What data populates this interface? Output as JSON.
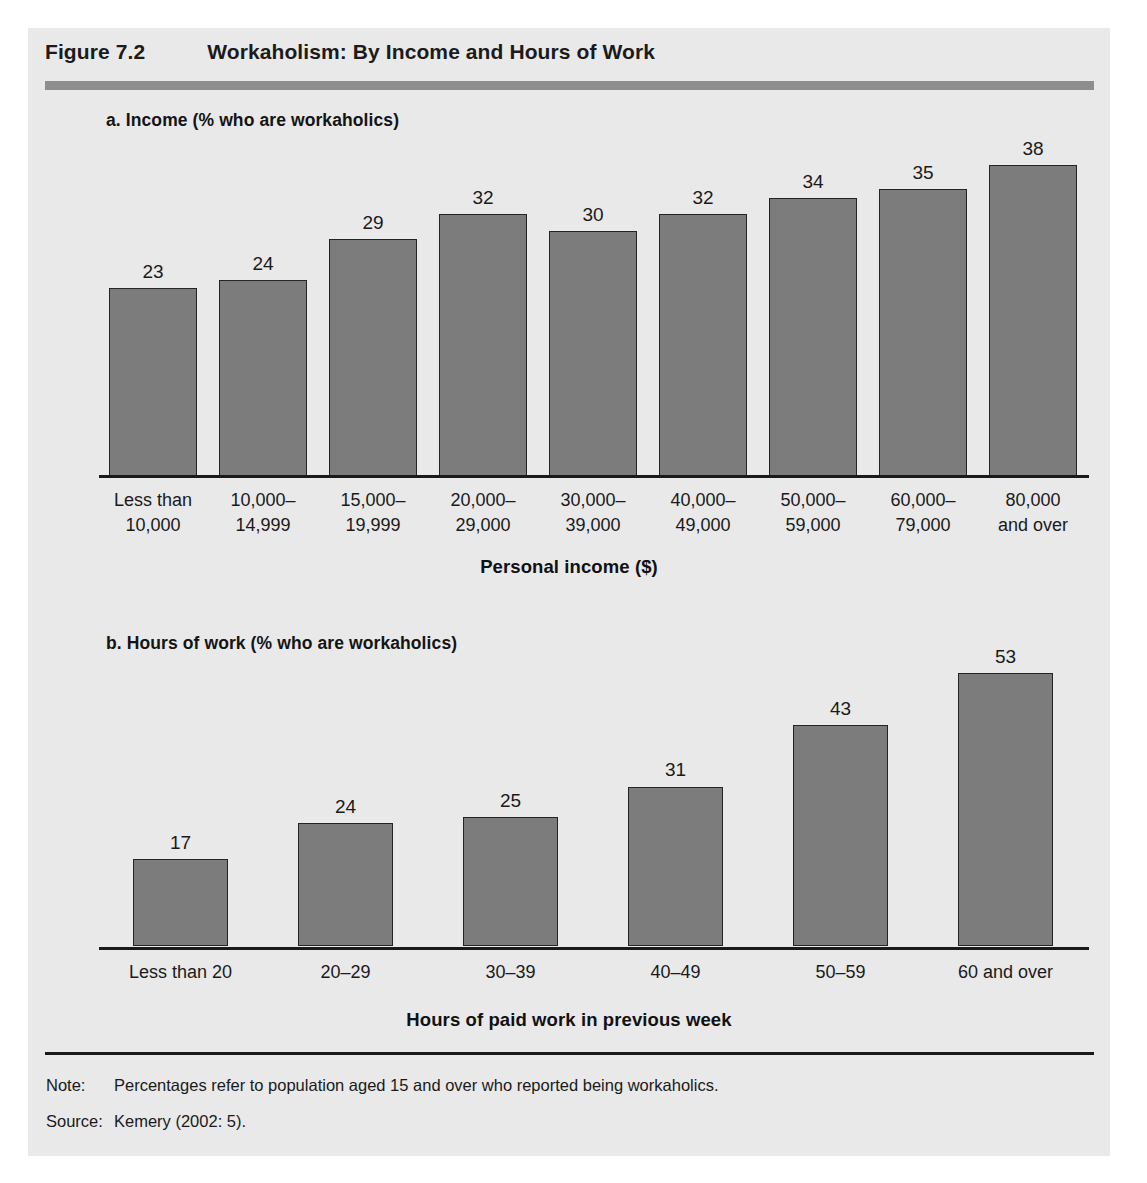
{
  "figure": {
    "number": "Figure 7.2",
    "title": "Workaholism: By Income and Hours of Work"
  },
  "panel_a": {
    "subtitle": "a. Income (% who are workaholics)",
    "axis_title": "Personal income ($)"
  },
  "panel_b": {
    "subtitle": "b. Hours of work (% who are workaholics)",
    "axis_title": "Hours of paid work in previous week"
  },
  "footer": {
    "note_label": "Note:",
    "note_text": "Percentages refer to population aged 15 and over who reported being workaholics.",
    "source_label": "Source:",
    "source_text": "Kemery (2002: 5)."
  },
  "colors": {
    "bar_fill": "#7c7c7c",
    "bar_border": "#242424",
    "panel_background": "#e9e9e9",
    "header_rule": "#8e8e8e",
    "text": "#1a1a1a"
  },
  "chart_data": [
    {
      "type": "bar",
      "id": "income",
      "title": "a. Income (% who are workaholics)",
      "xlabel": "Personal income ($)",
      "ylabel": "% who are workaholics",
      "ylim": [
        0,
        40
      ],
      "grid": false,
      "legend": "none",
      "categories": [
        "Less than\n10,000",
        "10,000–\n14,999",
        "15,000–\n19,999",
        "20,000–\n29,000",
        "30,000–\n39,000",
        "40,000–\n49,000",
        "50,000–\n59,000",
        "60,000–\n79,000",
        "80,000\nand over"
      ],
      "category_lines": [
        [
          "Less than",
          "10,000"
        ],
        [
          "10,000–",
          "14,999"
        ],
        [
          "15,000–",
          "19,999"
        ],
        [
          "20,000–",
          "29,000"
        ],
        [
          "30,000–",
          "39,000"
        ],
        [
          "40,000–",
          "49,000"
        ],
        [
          "50,000–",
          "59,000"
        ],
        [
          "60,000–",
          "79,000"
        ],
        [
          "80,000",
          "and over"
        ]
      ],
      "values": [
        23,
        24,
        29,
        32,
        30,
        32,
        34,
        35,
        38
      ]
    },
    {
      "type": "bar",
      "id": "hours",
      "title": "b. Hours of work (% who are workaholics)",
      "xlabel": "Hours of paid work in previous week",
      "ylabel": "% who are workaholics",
      "ylim": [
        0,
        55
      ],
      "grid": false,
      "legend": "none",
      "categories": [
        "Less than 20",
        "20–29",
        "30–39",
        "40–49",
        "50–59",
        "60 and over"
      ],
      "category_lines": [
        [
          "Less than 20"
        ],
        [
          "20–29"
        ],
        [
          "30–39"
        ],
        [
          "40–49"
        ],
        [
          "50–59"
        ],
        [
          "60 and over"
        ]
      ],
      "values": [
        17,
        24,
        25,
        31,
        43,
        53
      ]
    }
  ]
}
